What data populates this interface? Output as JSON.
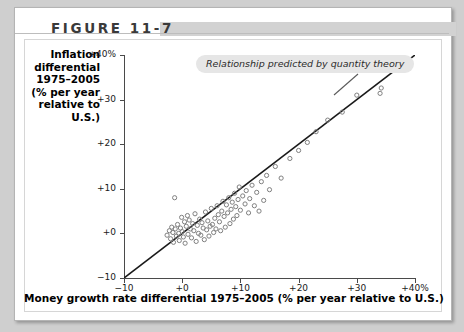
{
  "header": {
    "figure_number": "FIGURE 11-7"
  },
  "axis": {
    "y_title_lines": [
      "Inflation",
      "differential",
      "1975–2005",
      "(% per year",
      "relative to",
      "U.S.)"
    ],
    "x_title": "Money growth rate differential 1975–2005 (% per year relative to U.S.)"
  },
  "annotation": {
    "callout_text": "Relationship predicted by quantity theory"
  },
  "colors": {
    "axis": "#4a4a4a",
    "point_stroke": "#808080",
    "trendline": "#1a1a1a",
    "callout_bg": "#e6e6e6",
    "header_bar": "#d2d2d2",
    "page_bg": "#cfcfcf"
  },
  "chart_data": {
    "type": "scatter",
    "title": "FIGURE 11-7",
    "xlabel": "Money growth rate differential 1975–2005 (% per year relative to U.S.)",
    "ylabel": "Inflation differential 1975–2005 (% per year relative to U.S.)",
    "xlim": [
      -10,
      40
    ],
    "ylim": [
      -10,
      40
    ],
    "grid": false,
    "legend": null,
    "xticks": [
      -10,
      0,
      10,
      20,
      30,
      40
    ],
    "xtick_labels": [
      "−10",
      "+0",
      "+10",
      "+20",
      "+30",
      "+40%"
    ],
    "yticks": [
      -10,
      0,
      10,
      20,
      30,
      40
    ],
    "ytick_labels": [
      "−10",
      "+0",
      "+10",
      "+20",
      "+30",
      "+40%"
    ],
    "annotations": [
      {
        "text": "Relationship predicted by quantity theory",
        "x": 4,
        "y": 37,
        "style": "italic-rounded-box"
      }
    ],
    "reference_line": {
      "name": "45-degree line predicted by quantity theory",
      "slope": 1,
      "intercept": 0,
      "x_start": -10,
      "y_start": -10,
      "x_end": 40,
      "y_end": 40
    },
    "series": [
      {
        "name": "Countries",
        "marker": "open-circle",
        "points": [
          [
            -2.6,
            -0.4
          ],
          [
            -2.2,
            0.6
          ],
          [
            -2.0,
            -1.2
          ],
          [
            -1.8,
            1.4
          ],
          [
            -1.6,
            0.2
          ],
          [
            -1.5,
            -2.0
          ],
          [
            -1.3,
            8.0
          ],
          [
            -1.2,
            1.0
          ],
          [
            -1.0,
            -0.6
          ],
          [
            -0.8,
            2.0
          ],
          [
            -0.6,
            0.0
          ],
          [
            -0.5,
            -1.6
          ],
          [
            -0.3,
            1.2
          ],
          [
            -0.1,
            3.6
          ],
          [
            0.0,
            0.4
          ],
          [
            0.2,
            -0.8
          ],
          [
            0.4,
            2.6
          ],
          [
            0.5,
            -2.2
          ],
          [
            0.7,
            1.6
          ],
          [
            0.9,
            4.0
          ],
          [
            1.0,
            -0.2
          ],
          [
            1.2,
            3.0
          ],
          [
            1.4,
            1.0
          ],
          [
            1.6,
            -1.0
          ],
          [
            1.8,
            2.2
          ],
          [
            2.0,
            0.6
          ],
          [
            2.2,
            4.4
          ],
          [
            2.4,
            -1.8
          ],
          [
            2.6,
            1.8
          ],
          [
            2.8,
            0.0
          ],
          [
            3.0,
            3.2
          ],
          [
            3.2,
            -0.4
          ],
          [
            3.4,
            2.4
          ],
          [
            3.6,
            1.2
          ],
          [
            3.8,
            -1.4
          ],
          [
            4.0,
            4.8
          ],
          [
            4.2,
            0.8
          ],
          [
            4.4,
            2.8
          ],
          [
            4.6,
            -0.6
          ],
          [
            4.8,
            1.6
          ],
          [
            5.0,
            5.6
          ],
          [
            5.2,
            2.0
          ],
          [
            5.4,
            0.2
          ],
          [
            5.6,
            3.4
          ],
          [
            5.8,
            1.0
          ],
          [
            6.0,
            6.2
          ],
          [
            6.2,
            4.2
          ],
          [
            6.4,
            2.6
          ],
          [
            6.6,
            0.6
          ],
          [
            6.8,
            5.0
          ],
          [
            7.0,
            7.2
          ],
          [
            7.2,
            3.8
          ],
          [
            7.4,
            1.4
          ],
          [
            7.6,
            6.4
          ],
          [
            7.8,
            4.6
          ],
          [
            8.0,
            8.0
          ],
          [
            8.2,
            2.2
          ],
          [
            8.4,
            5.4
          ],
          [
            8.6,
            7.0
          ],
          [
            8.8,
            3.2
          ],
          [
            9.0,
            9.0
          ],
          [
            9.2,
            6.0
          ],
          [
            9.4,
            4.0
          ],
          [
            9.6,
            7.6
          ],
          [
            9.8,
            10.4
          ],
          [
            10.0,
            5.2
          ],
          [
            10.4,
            8.4
          ],
          [
            10.8,
            6.6
          ],
          [
            11.0,
            9.6
          ],
          [
            11.4,
            4.6
          ],
          [
            11.6,
            7.8
          ],
          [
            12.0,
            10.8
          ],
          [
            12.4,
            6.2
          ],
          [
            12.8,
            9.2
          ],
          [
            13.2,
            5.0
          ],
          [
            13.6,
            11.6
          ],
          [
            14.0,
            7.4
          ],
          [
            14.5,
            13.0
          ],
          [
            15.0,
            9.8
          ],
          [
            16.0,
            15.0
          ],
          [
            17.0,
            12.4
          ],
          [
            18.5,
            16.8
          ],
          [
            20.0,
            18.6
          ],
          [
            21.5,
            20.4
          ],
          [
            23.0,
            22.8
          ],
          [
            25.0,
            25.4
          ],
          [
            27.5,
            27.2
          ],
          [
            30.0,
            31.0
          ],
          [
            34.0,
            31.4
          ],
          [
            34.2,
            32.6
          ]
        ]
      }
    ]
  }
}
